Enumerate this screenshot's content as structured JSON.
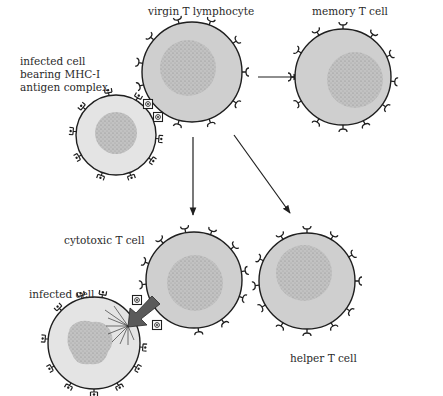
{
  "figure": {
    "labels": {
      "virgin": "virgin T lymphocyte",
      "memory": "memory T cell",
      "infected_top_1": "infected cell",
      "infected_top_2": "bearing MHC-I",
      "infected_top_3": "antigen complex",
      "cytotoxic": "cytotoxic T cell",
      "infected_bottom": "infected cell",
      "helper": "helper T cell"
    },
    "colors": {
      "t_cell_fill": "#cfcfcf",
      "infected_fill": "#e4e4e4",
      "nucleus_fill": "#b8b8b8",
      "outline": "#1f1f1f",
      "kill_arrow": "#5a5a5a"
    },
    "cells": [
      {
        "id": "virgin",
        "type": "T cell",
        "cx": 192,
        "cy": 72,
        "r": 50
      },
      {
        "id": "memory",
        "type": "T cell",
        "cx": 343,
        "cy": 77,
        "r": 48
      },
      {
        "id": "infected_top",
        "type": "infected cell",
        "cx": 116,
        "cy": 135,
        "r": 40
      },
      {
        "id": "cytotoxic",
        "type": "T cell",
        "cx": 194,
        "cy": 280,
        "r": 48
      },
      {
        "id": "helper",
        "type": "T cell",
        "cx": 307,
        "cy": 281,
        "r": 48
      },
      {
        "id": "infected_bottom",
        "type": "infected cell (lysing)",
        "cx": 94,
        "cy": 343,
        "r": 46
      }
    ],
    "arrows": [
      {
        "from": "virgin",
        "to": "memory"
      },
      {
        "from": "virgin",
        "to": "cytotoxic"
      },
      {
        "from": "virgin",
        "to": "helper"
      },
      {
        "from": "cytotoxic",
        "to": "infected_bottom",
        "style": "kill"
      }
    ]
  }
}
